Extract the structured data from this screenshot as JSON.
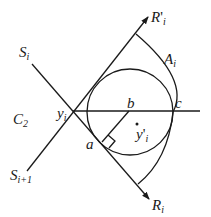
{
  "diagram": {
    "colors": {
      "stroke": "#1a1a1a",
      "background": "#ffffff"
    },
    "labels": {
      "S_i": {
        "base": "S",
        "sub": "i"
      },
      "S_i_plus_1": {
        "base": "S",
        "sub": "i+1"
      },
      "C_2": {
        "base": "C",
        "sub": "2"
      },
      "y_i": {
        "base": "y",
        "sub": "i"
      },
      "y_prime_i": {
        "base": "y",
        "prime": "'",
        "sub": "i"
      },
      "R_prime_i": {
        "base": "R",
        "prime": "'",
        "sub": "i"
      },
      "R_i": {
        "base": "R",
        "sub": "i"
      },
      "A_i": {
        "base": "A",
        "sub": "i"
      },
      "a": "a",
      "b": "b",
      "c": "c"
    }
  }
}
